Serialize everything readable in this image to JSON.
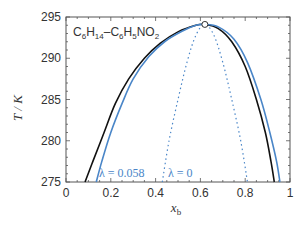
{
  "chart_data": {
    "type": "line",
    "title": "",
    "system_label": {
      "parts": [
        [
          "C",
          "6",
          "H",
          "14",
          "–C",
          "6",
          "H",
          "5",
          "NO",
          "2"
        ]
      ],
      "text": "C6H14–C6H5NO2"
    },
    "xlabel": "x_b",
    "xlabel_main": "x",
    "xlabel_sub": "b",
    "ylabel": "T / K",
    "xlim": [
      0,
      1
    ],
    "ylim": [
      275,
      295
    ],
    "xticks": [
      0,
      0.2,
      0.4,
      0.6,
      0.8,
      1
    ],
    "xtick_labels": [
      "0",
      "0.2",
      "0.4",
      "0.6",
      "0.8",
      "1"
    ],
    "yticks": [
      275,
      280,
      285,
      290,
      295
    ],
    "ytick_labels": [
      "275",
      "280",
      "285",
      "290",
      "295"
    ],
    "grid": false,
    "critical_point": {
      "x": 0.62,
      "y": 294.1
    },
    "series": [
      {
        "name": "experimental (black)",
        "color": "#111111",
        "style": "solid",
        "x": [
          0.085,
          0.12,
          0.17,
          0.22,
          0.28,
          0.35,
          0.42,
          0.5,
          0.58,
          0.62,
          0.68,
          0.74,
          0.8,
          0.85,
          0.89,
          0.915,
          0.93
        ],
        "y": [
          275,
          277.5,
          281,
          284.5,
          287.5,
          290,
          291.8,
          293.2,
          294.0,
          294.1,
          293.6,
          292.0,
          289.0,
          285.0,
          281.0,
          277.5,
          275
        ]
      },
      {
        "name": "λ = 0.058",
        "color": "#4a86c8",
        "style": "solid",
        "x": [
          0.135,
          0.16,
          0.2,
          0.25,
          0.3,
          0.37,
          0.44,
          0.52,
          0.58,
          0.62,
          0.68,
          0.75,
          0.81,
          0.87,
          0.91,
          0.94,
          0.955
        ],
        "y": [
          275,
          277.5,
          281,
          284.5,
          287.5,
          290.2,
          292.0,
          293.3,
          294.0,
          294.1,
          293.8,
          292.3,
          289.5,
          285.0,
          281.0,
          277.5,
          275
        ]
      },
      {
        "name": "λ = 0",
        "color": "#4a86c8",
        "style": "dotted",
        "x": [
          0.43,
          0.46,
          0.5,
          0.54,
          0.58,
          0.62,
          0.66,
          0.7,
          0.74,
          0.78,
          0.81
        ],
        "y": [
          275,
          280,
          285,
          289.5,
          292.8,
          294.1,
          292.8,
          289.5,
          285,
          280,
          275
        ]
      }
    ],
    "annotations": [
      {
        "text": "λ = 0.058",
        "x": 0.16,
        "y": 276.3,
        "color": "#4a86c8"
      },
      {
        "text": "λ = 0",
        "x": 0.45,
        "y": 276.3,
        "color": "#4a86c8"
      }
    ]
  },
  "labels": {
    "formula_c1": "C",
    "formula_s1": "6",
    "formula_h1": "H",
    "formula_s2": "14",
    "formula_dash": "–C",
    "formula_s3": "6",
    "formula_h2": "H",
    "formula_s4": "5",
    "formula_no": "NO",
    "formula_s5": "2",
    "ylabel": "T / K",
    "xlabel_main": "x",
    "xlabel_sub": "b",
    "annot1": "λ = 0.058",
    "annot2": "λ = 0"
  }
}
